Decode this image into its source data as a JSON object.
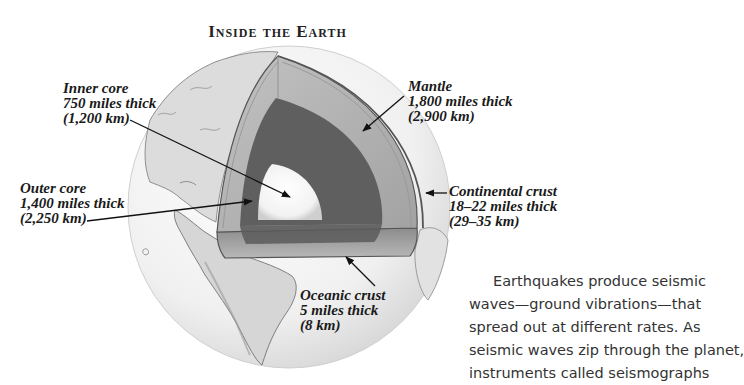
{
  "title": "Inside the Earth",
  "labels": {
    "inner_core": {
      "name": "Inner core",
      "thickness_miles": "750 miles thick",
      "thickness_km": "(1,200 km)"
    },
    "outer_core": {
      "name": "Outer core",
      "thickness_miles": "1,400 miles thick",
      "thickness_km": "(2,250 km)"
    },
    "mantle": {
      "name": "Mantle",
      "thickness_miles": "1,800 miles thick",
      "thickness_km": "(2,900 km)"
    },
    "continental_crust": {
      "name": "Continental crust",
      "thickness_miles": "18–22 miles thick",
      "thickness_km": "(29–35 km)"
    },
    "oceanic_crust": {
      "name": "Oceanic crust",
      "thickness_miles": "5 miles thick",
      "thickness_km": "(8 km)"
    }
  },
  "paragraph": {
    "lines": [
      "Earthquakes produce seismic",
      "waves—ground vibrations—that",
      "spread out at different rates. As",
      "seismic waves zip through the planet,",
      "instruments called seismographs"
    ]
  },
  "colors": {
    "inner_core": "#f4f4f4",
    "outer_core": "#5f5f5f",
    "mantle": "#b0b0b0",
    "crust_edge": "#6a6a6a",
    "globe": "#ececec",
    "land": "#d4d4d4",
    "text": "#1a1a1a"
  }
}
